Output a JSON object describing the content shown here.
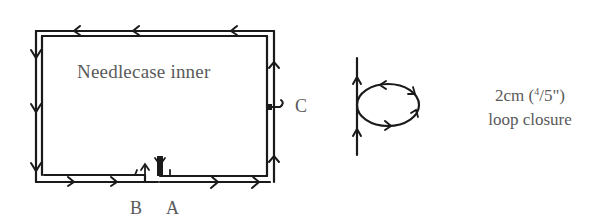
{
  "diagram": {
    "title": "Needlecase inner",
    "points": {
      "b": "B",
      "a": "A",
      "c": "C"
    },
    "caption": {
      "line1": "2cm (4/5\")",
      "line1_main": "2cm (",
      "line1_num": "4",
      "line1_frac": "/5\")",
      "line2": "loop closure"
    },
    "colors": {
      "stroke": "#1a1a1a",
      "text": "#5a5a5a",
      "background": "#ffffff"
    }
  }
}
